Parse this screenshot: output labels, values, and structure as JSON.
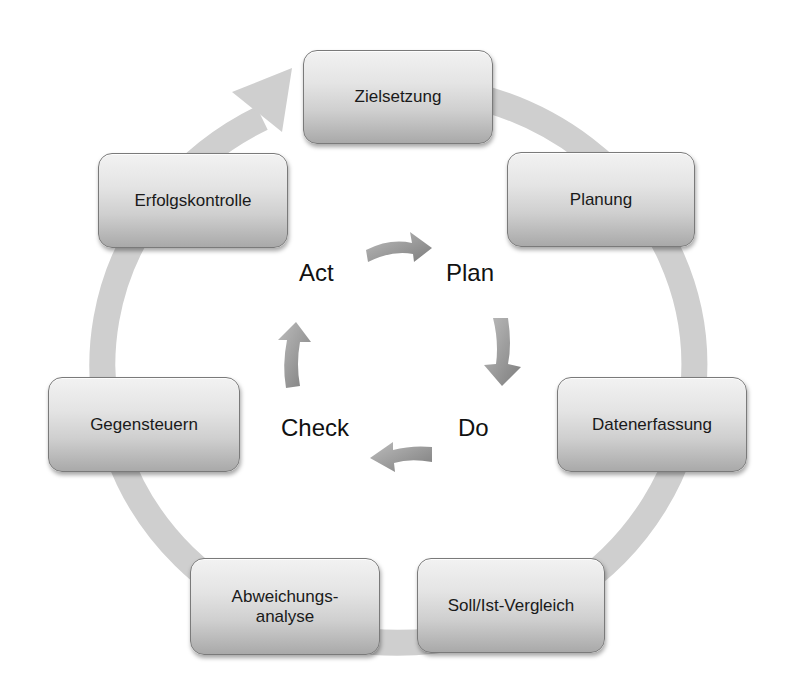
{
  "diagram": {
    "type": "cycle",
    "outer_cycle": {
      "steps": [
        {
          "id": "zielsetzung",
          "label": "Zielsetzung"
        },
        {
          "id": "planung",
          "label": "Planung"
        },
        {
          "id": "datenerfassung",
          "label": "Datenerfassung"
        },
        {
          "id": "soll-ist-vergleich",
          "label": "Soll/Ist-Vergleich"
        },
        {
          "id": "abweichungsanalyse",
          "label": "Abweichungs-\nanalyse"
        },
        {
          "id": "gegensteuern",
          "label": "Gegensteuern"
        },
        {
          "id": "erfolgskontrolle",
          "label": "Erfolgskontrolle"
        }
      ],
      "direction": "clockwise",
      "ring_color": "#c8c8c8"
    },
    "inner_cycle": {
      "steps": [
        {
          "id": "plan",
          "label": "Plan"
        },
        {
          "id": "do",
          "label": "Do"
        },
        {
          "id": "check",
          "label": "Check"
        },
        {
          "id": "act",
          "label": "Act"
        }
      ],
      "direction": "clockwise",
      "arrow_color": "#8c8c8c"
    }
  }
}
